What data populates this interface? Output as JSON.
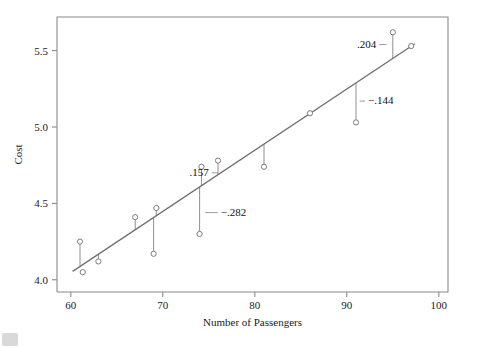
{
  "chart_data": {
    "type": "scatter",
    "title": "",
    "xlabel": "Number of Passengers",
    "ylabel": "Cost",
    "xlim": [
      58.5,
      101
    ],
    "ylim": [
      3.92,
      5.72
    ],
    "xticks": [
      60,
      70,
      80,
      90,
      100
    ],
    "yticks": [
      "4.0",
      "4.5",
      "5.0",
      "5.5"
    ],
    "ytick_values": [
      4.0,
      4.5,
      5.0,
      5.5
    ],
    "grid": false,
    "legend": null,
    "points": [
      {
        "x": 61.0,
        "y": 4.25
      },
      {
        "x": 61.3,
        "y": 4.05
      },
      {
        "x": 63.0,
        "y": 4.12
      },
      {
        "x": 67.0,
        "y": 4.41
      },
      {
        "x": 69.0,
        "y": 4.17
      },
      {
        "x": 69.3,
        "y": 4.47
      },
      {
        "x": 74.0,
        "y": 4.3
      },
      {
        "x": 74.2,
        "y": 4.74
      },
      {
        "x": 76.0,
        "y": 4.78
      },
      {
        "x": 81.0,
        "y": 4.74
      },
      {
        "x": 86.0,
        "y": 5.09
      },
      {
        "x": 91.0,
        "y": 5.03
      },
      {
        "x": 95.0,
        "y": 5.62
      },
      {
        "x": 97.0,
        "y": 5.53
      }
    ],
    "fit_line": {
      "x1": 60.2,
      "y1": 4.055,
      "x2": 97.4,
      "y2": 5.545
    },
    "residual_segments": [
      {
        "x": 61.0,
        "y_point": 4.25,
        "y_fit": 4.087
      },
      {
        "x": 63.0,
        "y_point": 4.12,
        "y_fit": 4.167
      },
      {
        "x": 67.0,
        "y_point": 4.41,
        "y_fit": 4.327
      },
      {
        "x": 69.0,
        "y_point": 4.17,
        "y_fit": 4.407
      },
      {
        "x": 69.3,
        "y_point": 4.47,
        "y_fit": 4.419
      },
      {
        "x": 74.0,
        "y_point": 4.3,
        "y_fit": 4.607
      },
      {
        "x": 74.2,
        "y_point": 4.74,
        "y_fit": 4.615
      },
      {
        "x": 76.0,
        "y_point": 4.78,
        "y_fit": 4.687
      },
      {
        "x": 81.0,
        "y_point": 4.74,
        "y_fit": 4.887
      },
      {
        "x": 86.0,
        "y_point": 5.09,
        "y_fit": 5.087
      },
      {
        "x": 91.0,
        "y_point": 5.03,
        "y_fit": 5.287
      },
      {
        "x": 95.0,
        "y_point": 5.62,
        "y_fit": 5.447
      },
      {
        "x": 97.0,
        "y_point": 5.53,
        "y_fit": 5.527
      }
    ],
    "annotations": [
      {
        "label": ".157",
        "x": 75.0,
        "y": 4.68,
        "anchor": "end",
        "leader_to_x": 76.0,
        "leader_to_y": 4.68
      },
      {
        "label": "−.282",
        "x": 76.3,
        "y": 4.42,
        "anchor": "start",
        "leader_to_x": 74.6,
        "leader_to_y": 4.42
      },
      {
        "label": ".204",
        "x": 93.2,
        "y": 5.52,
        "anchor": "end",
        "leader_to_x": 94.3,
        "leader_to_y": 5.52
      },
      {
        "label": "−.144",
        "x": 92.3,
        "y": 5.15,
        "anchor": "start",
        "leader_to_x": 91.4,
        "leader_to_y": 5.15
      }
    ]
  },
  "figure": {
    "background_color": "#ffffff",
    "line_color": "#6f6f6f",
    "marker_edge_color": "#7d7d7d",
    "axis_color": "#8a8a8a",
    "text_color": "#1a1a1a"
  }
}
